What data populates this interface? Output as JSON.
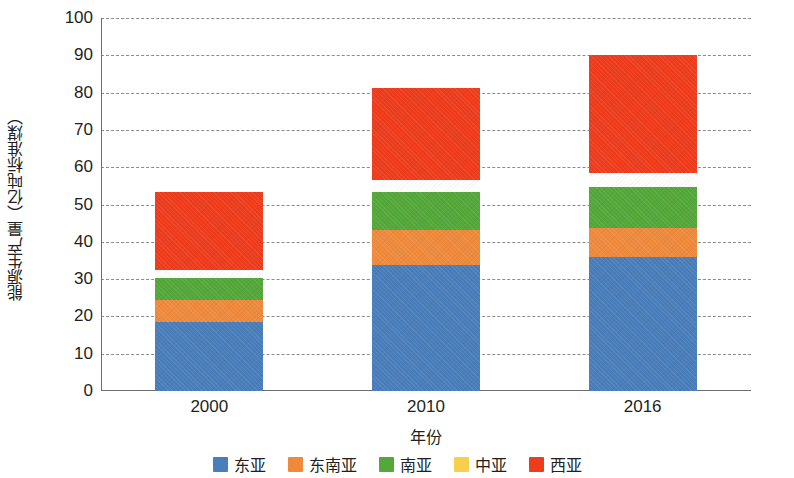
{
  "chart_data": {
    "type": "bar",
    "subtype": "stacked-bar",
    "title": "",
    "xlabel": "年份",
    "ylabel": "能源生产量（亿吨标准煤）",
    "categories": [
      "2000",
      "2010",
      "2016"
    ],
    "ylim": [
      0,
      100
    ],
    "y_ticks": [
      0,
      10,
      20,
      30,
      40,
      50,
      60,
      70,
      80,
      90,
      100
    ],
    "grid": true,
    "grid_style": "dashed-horizontal",
    "legend_position": "bottom-center",
    "series": [
      {
        "name": "东亚",
        "color": "#4a7ebb",
        "values": [
          18.5,
          33.8,
          35.8
        ]
      },
      {
        "name": "东南亚",
        "color": "#ef8a3c",
        "values": [
          6.0,
          9.5,
          8.0
        ]
      },
      {
        "name": "南亚",
        "color": "#54a83a",
        "values": [
          5.9,
          10.0,
          10.9
        ]
      },
      {
        "name": "中亚",
        "color": "#f6c council",
        "values": [
          2.0,
          3.2,
          3.8
        ]
      },
      {
        "name": "西亚",
        "color": "#ef3c1c",
        "values": [
          20.9,
          24.7,
          31.5
        ]
      }
    ],
    "totals": [
      53.3,
      81.2,
      90.0
    ],
    "annotations": []
  },
  "axis": {
    "y_tick_labels": [
      "100",
      "90",
      "80",
      "70",
      "60",
      "50",
      "40",
      "30",
      "20",
      "10",
      "0"
    ],
    "x_tick_labels": [
      "2000",
      "2010",
      "2016"
    ],
    "y_title": "能源生产量（亿吨标准煤）",
    "x_title": "年份"
  },
  "legend": {
    "items": [
      {
        "label": "东亚",
        "color": "#4a7ebb"
      },
      {
        "label": "东南亚",
        "color": "#ef8a3c"
      },
      {
        "label": "南亚",
        "color": "#54a83a"
      },
      {
        "label": "中亚",
        "color": "#f7cf4d"
      },
      {
        "label": "西亚",
        "color": "#ef3c1c"
      }
    ]
  },
  "colors": {
    "background": "#ffffff",
    "axis": "#6e6e6e",
    "grid": "#8c8c8c",
    "text": "#231f20"
  }
}
